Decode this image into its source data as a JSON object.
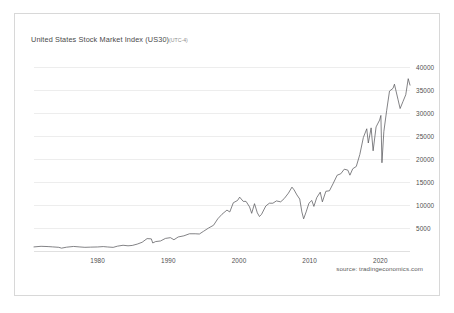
{
  "chart_data": {
    "type": "line",
    "title": "United States Stock Market Index (US30)",
    "title_timezone": "(UTC-4)",
    "source": "source: tradingeconomics.com",
    "xlabel": "",
    "ylabel": "",
    "grid": true,
    "legend": "none",
    "line_color": "#59595e",
    "grid_color": "#ededed",
    "axis_color": "#e0e0e0",
    "text_color": "#4f4f4f",
    "xlim": [
      1971.0,
      2024.2
    ],
    "ylim": [
      0,
      42000
    ],
    "xticks": [
      1980,
      1990,
      2000,
      2010,
      2020
    ],
    "xtick_labels": [
      "1980",
      "1990",
      "2000",
      "2010",
      "2020"
    ],
    "yticks": [
      5000,
      10000,
      15000,
      20000,
      25000,
      30000,
      35000,
      40000
    ],
    "ytick_labels": [
      "5000",
      "10000",
      "15000",
      "20000",
      "25000",
      "30000",
      "35000",
      "40000"
    ],
    "series": [
      {
        "name": "US30",
        "x": [
          1971.0,
          1972.0,
          1973.0,
          1973.6,
          1974.5,
          1974.9,
          1975.6,
          1976.6,
          1977.5,
          1978.2,
          1979.0,
          1980.0,
          1980.8,
          1981.4,
          1982.2,
          1982.8,
          1983.6,
          1984.3,
          1984.9,
          1985.6,
          1986.3,
          1987.0,
          1987.6,
          1987.8,
          1988.2,
          1988.9,
          1989.6,
          1990.3,
          1990.8,
          1991.4,
          1992.2,
          1993.0,
          1993.8,
          1994.4,
          1995.0,
          1995.7,
          1996.4,
          1997.0,
          1997.6,
          1998.3,
          1998.7,
          1999.2,
          1999.8,
          2000.1,
          2000.6,
          2001.0,
          2001.5,
          2001.8,
          2002.2,
          2002.6,
          2002.9,
          2003.2,
          2003.8,
          2004.3,
          2004.8,
          2005.3,
          2005.9,
          2006.4,
          2007.0,
          2007.5,
          2007.8,
          2008.2,
          2008.6,
          2008.9,
          2009.15,
          2009.5,
          2009.9,
          2010.3,
          2010.6,
          2011.0,
          2011.5,
          2011.8,
          2012.3,
          2012.8,
          2013.3,
          2013.9,
          2014.4,
          2014.9,
          2015.4,
          2015.7,
          2016.1,
          2016.6,
          2017.1,
          2017.6,
          2018.08,
          2018.3,
          2018.7,
          2018.98,
          2019.4,
          2019.9,
          2020.08,
          2020.23,
          2020.5,
          2020.9,
          2021.3,
          2021.8,
          2022.0,
          2022.5,
          2022.8,
          2023.2,
          2023.6,
          2023.95,
          2024.2
        ],
        "y": [
          890,
          1020,
          960,
          900,
          800,
          620,
          830,
          990,
          880,
          800,
          840,
          880,
          960,
          880,
          790,
          1050,
          1250,
          1130,
          1210,
          1500,
          1900,
          2700,
          2640,
          1740,
          2050,
          2180,
          2740,
          2900,
          2450,
          3050,
          3300,
          3750,
          3750,
          3700,
          4300,
          5000,
          5600,
          7000,
          8000,
          8900,
          8500,
          10500,
          11000,
          11720,
          10800,
          10800,
          9600,
          8200,
          10300,
          8300,
          7500,
          8000,
          9800,
          10400,
          10400,
          10900,
          10700,
          11400,
          12600,
          13900,
          13300,
          12200,
          11300,
          8500,
          7000,
          8500,
          10400,
          11000,
          9700,
          11600,
          12800,
          10700,
          13000,
          13100,
          14600,
          16500,
          16800,
          17800,
          17600,
          16500,
          17900,
          18400,
          21000,
          24700,
          26600,
          23500,
          26800,
          21800,
          27000,
          28500,
          29500,
          19200,
          26000,
          30600,
          34800,
          35400,
          36300,
          33000,
          31000,
          32500,
          34000,
          37500,
          36100
        ]
      }
    ],
    "annotations": []
  }
}
